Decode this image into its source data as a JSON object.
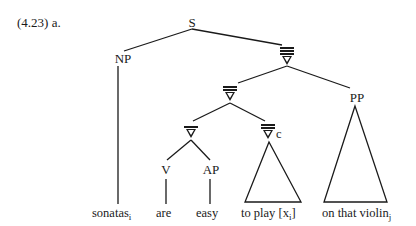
{
  "example": {
    "label": "(4.23) a."
  },
  "nodes": {
    "root": {
      "label": "S"
    },
    "np": {
      "label": "NP"
    },
    "vbar3": {
      "label": "∇",
      "bars": 3
    },
    "vbar2": {
      "label": "∇",
      "bars": 2
    },
    "vbar1": {
      "label": "∇",
      "bars": 1
    },
    "vbar2c": {
      "label": "∇",
      "bars": 2,
      "subscript": "c"
    },
    "v": {
      "label": "V"
    },
    "ap": {
      "label": "AP"
    },
    "pp": {
      "label": "PP"
    }
  },
  "leaves": [
    {
      "text": "sonatas",
      "subscript": "i"
    },
    {
      "text": "are",
      "subscript": ""
    },
    {
      "text": "easy",
      "subscript": ""
    },
    {
      "text": "to play [x",
      "subscript": "i",
      "suffix": "]"
    },
    {
      "text": "on that violin",
      "subscript": "j"
    }
  ],
  "structure": {
    "S": [
      "NP",
      "∇'''"
    ],
    "NP": [
      "sonatas_i"
    ],
    "∇'''": [
      "∇''",
      "PP"
    ],
    "∇''": [
      "∇'",
      "∇''_c"
    ],
    "∇'": [
      "V",
      "AP"
    ],
    "V": [
      "are"
    ],
    "AP": [
      "easy"
    ],
    "∇''_c": [
      "to play [x_i] (triangle)"
    ],
    "PP": [
      "on that violin_j (triangle)"
    ]
  }
}
